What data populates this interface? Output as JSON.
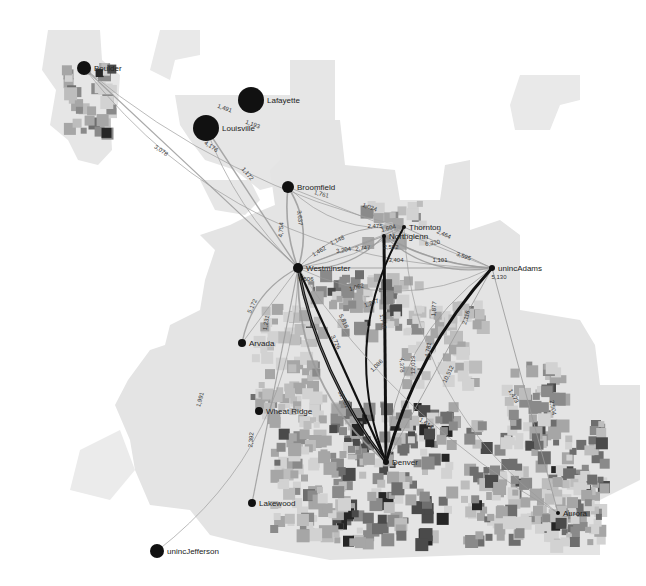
{
  "map": {
    "title": "Commuter flows, Denver metro area",
    "colors": {
      "background": "#ffffff",
      "region_light": "#e6e6e6",
      "region_mid": "#bdbdbd",
      "region_dark": "#7a7a7a",
      "region_darkest": "#262626",
      "flow_light": "#9a9a9a",
      "flow_heavy": "#111111",
      "node": "#111111"
    },
    "nodes": [
      {
        "id": "boulder",
        "label": "Boulder",
        "x": 84,
        "y": 68,
        "r": 7,
        "count": ""
      },
      {
        "id": "lafayette",
        "label": "Lafayette",
        "x": 251,
        "y": 100,
        "r": 13,
        "count": ""
      },
      {
        "id": "louisville",
        "label": "Louisville",
        "x": 206,
        "y": 128,
        "r": 13,
        "count": ""
      },
      {
        "id": "broomfield",
        "label": "Broomfield",
        "x": 288,
        "y": 187,
        "r": 6,
        "count": "3,747"
      },
      {
        "id": "thornton",
        "label": "Thornton",
        "x": 404,
        "y": 227,
        "r": 2,
        "count": ""
      },
      {
        "id": "northglenn",
        "label": "Northglenn",
        "x": 384,
        "y": 236,
        "r": 2,
        "count": "2,552"
      },
      {
        "id": "westminster",
        "label": "Westminster",
        "x": 298,
        "y": 268,
        "r": 5,
        "count": "9,506"
      },
      {
        "id": "uncadams",
        "label": "unincAdams",
        "x": 492,
        "y": 268,
        "r": 3,
        "count": "5,130"
      },
      {
        "id": "arvada",
        "label": "Arvada",
        "x": 242,
        "y": 343,
        "r": 4,
        "count": ""
      },
      {
        "id": "wheatridge",
        "label": "Wheat Ridge",
        "x": 259,
        "y": 411,
        "r": 4,
        "count": ""
      },
      {
        "id": "lakewood",
        "label": "Lakewood",
        "x": 252,
        "y": 503,
        "r": 4,
        "count": ""
      },
      {
        "id": "uncjefferson",
        "label": "unincJefferson",
        "x": 157,
        "y": 551,
        "r": 7,
        "count": ""
      },
      {
        "id": "denver",
        "label": "Denver",
        "x": 386,
        "y": 462,
        "r": 3,
        "count": ""
      },
      {
        "id": "aurora",
        "label": "Aurora",
        "x": 558,
        "y": 513,
        "r": 2,
        "count": ""
      }
    ],
    "flows": [
      {
        "from": "boulder",
        "to": "westminster",
        "value": "3,078",
        "weight": 1.2,
        "heavy": false
      },
      {
        "from": "boulder",
        "to": "thornton",
        "value": "1,491",
        "weight": 0.8,
        "heavy": false
      },
      {
        "from": "boulder",
        "to": "uncadams",
        "value": "1,193",
        "weight": 0.8,
        "heavy": false
      },
      {
        "from": "louisville",
        "to": "westminster",
        "value": "4,176",
        "weight": 1.4,
        "heavy": false
      },
      {
        "from": "louisville",
        "to": "westminster",
        "value": "1,172",
        "weight": 0.8,
        "heavy": false
      },
      {
        "from": "broomfield",
        "to": "thornton",
        "value": "1,761",
        "weight": 0.8,
        "heavy": false
      },
      {
        "from": "broomfield",
        "to": "uncadams",
        "value": "1,024",
        "weight": 0.8,
        "heavy": false
      },
      {
        "from": "broomfield",
        "to": "westminster",
        "value": "3,637",
        "weight": 1.6,
        "heavy": false
      },
      {
        "from": "westminster",
        "to": "broomfield",
        "value": "4,754",
        "weight": 1.6,
        "heavy": false
      },
      {
        "from": "westminster",
        "to": "thornton",
        "value": "1,148",
        "weight": 0.8,
        "heavy": false
      },
      {
        "from": "westminster",
        "to": "thornton",
        "value": "1,462",
        "weight": 0.8,
        "heavy": false
      },
      {
        "from": "westminster",
        "to": "northglenn",
        "value": "3,204",
        "weight": 1.2,
        "heavy": false
      },
      {
        "from": "westminster",
        "to": "northglenn",
        "value": "2,747",
        "weight": 1.1,
        "heavy": false
      },
      {
        "from": "thornton",
        "to": "northglenn",
        "value": "1,604",
        "weight": 0.8,
        "heavy": false
      },
      {
        "from": "thornton",
        "to": "westminster",
        "value": "2,475",
        "weight": 1,
        "heavy": false
      },
      {
        "from": "thornton",
        "to": "uncadams",
        "value": "2,464",
        "weight": 1,
        "heavy": false
      },
      {
        "from": "northglenn",
        "to": "uncadams",
        "value": "6,320",
        "weight": 1.6,
        "heavy": false
      },
      {
        "from": "northglenn",
        "to": "uncadams",
        "value": "3,595",
        "weight": 1.3,
        "heavy": false
      },
      {
        "from": "westminster",
        "to": "uncadams",
        "value": "3,404",
        "weight": 1.2,
        "heavy": false
      },
      {
        "from": "northglenn",
        "to": "uncadams",
        "value": "1,101",
        "weight": 0.8,
        "heavy": false
      },
      {
        "from": "westminster",
        "to": "uncadams",
        "value": "1,062",
        "weight": 0.8,
        "heavy": false
      },
      {
        "from": "westminster",
        "to": "denver",
        "value": "1,297",
        "weight": 0.8,
        "heavy": false
      },
      {
        "from": "westminster",
        "to": "denver",
        "value": "1,748",
        "weight": 0.9,
        "heavy": false
      },
      {
        "from": "westminster",
        "to": "denver",
        "value": "5,818",
        "weight": 1.8,
        "heavy": false
      },
      {
        "from": "westminster",
        "to": "denver",
        "value": "3,726",
        "weight": 2.2,
        "heavy": true
      },
      {
        "from": "westminster",
        "to": "denver",
        "value": "12,701",
        "weight": 3,
        "heavy": true
      },
      {
        "from": "westminster",
        "to": "arvada",
        "value": "5,172",
        "weight": 1.4,
        "heavy": false
      },
      {
        "from": "westminster",
        "to": "arvada",
        "value": "1,231",
        "weight": 0.8,
        "heavy": false
      },
      {
        "from": "westminster",
        "to": "denver",
        "value": "1,086",
        "weight": 0.8,
        "heavy": false
      },
      {
        "from": "thornton",
        "to": "denver",
        "value": "4,378",
        "weight": 2,
        "heavy": true
      },
      {
        "from": "northglenn",
        "to": "denver",
        "value": "12,013",
        "weight": 3,
        "heavy": true
      },
      {
        "from": "uncadams",
        "to": "denver",
        "value": "4,781",
        "weight": 1.4,
        "heavy": false
      },
      {
        "from": "uncadams",
        "to": "denver",
        "value": "1,877",
        "weight": 0.9,
        "heavy": false
      },
      {
        "from": "uncadams",
        "to": "denver",
        "value": "2,116",
        "weight": 1,
        "heavy": false
      },
      {
        "from": "uncadams",
        "to": "denver",
        "value": "10,512",
        "weight": 3,
        "heavy": true
      },
      {
        "from": "thornton",
        "to": "aurora",
        "value": "1,473",
        "weight": 0.8,
        "heavy": false
      },
      {
        "from": "uncadams",
        "to": "aurora",
        "value": "2,504",
        "weight": 1,
        "heavy": false
      },
      {
        "from": "westminster",
        "to": "aurora",
        "value": "1,614",
        "weight": 0.8,
        "heavy": false
      },
      {
        "from": "uncjefferson",
        "to": "westminster",
        "value": "1,991",
        "weight": 0.8,
        "heavy": false
      },
      {
        "from": "lakewood",
        "to": "westminster",
        "value": "2,392",
        "weight": 1.2,
        "heavy": false
      }
    ],
    "flow_label_positions": [
      {
        "value": "3,078",
        "x": 160,
        "y": 152,
        "rot": 35
      },
      {
        "value": "1,491",
        "x": 224,
        "y": 110,
        "rot": 20
      },
      {
        "value": "1,193",
        "x": 252,
        "y": 126,
        "rot": 20
      },
      {
        "value": "4,176",
        "x": 210,
        "y": 148,
        "rot": 35
      },
      {
        "value": "1,172",
        "x": 246,
        "y": 175,
        "rot": 50
      },
      {
        "value": "1,761",
        "x": 321,
        "y": 196,
        "rot": 15
      },
      {
        "value": "1,024",
        "x": 369,
        "y": 209,
        "rot": 20
      },
      {
        "value": "3,637",
        "x": 298,
        "y": 218,
        "rot": 85
      },
      {
        "value": "4,754",
        "x": 283,
        "y": 230,
        "rot": -85
      },
      {
        "value": "1,148",
        "x": 338,
        "y": 242,
        "rot": -25
      },
      {
        "value": "1,462",
        "x": 320,
        "y": 253,
        "rot": -30
      },
      {
        "value": "3,204",
        "x": 344,
        "y": 252,
        "rot": -10
      },
      {
        "value": "2,747",
        "x": 363,
        "y": 250,
        "rot": -5
      },
      {
        "value": "1,604",
        "x": 389,
        "y": 230,
        "rot": -15
      },
      {
        "value": "2,475",
        "x": 375,
        "y": 228,
        "rot": 0
      },
      {
        "value": "2,552",
        "x": 391,
        "y": 249,
        "rot": 0
      },
      {
        "value": "2,464",
        "x": 443,
        "y": 236,
        "rot": 25
      },
      {
        "value": "6,320",
        "x": 433,
        "y": 245,
        "rot": -10
      },
      {
        "value": "3,595",
        "x": 463,
        "y": 258,
        "rot": 20
      },
      {
        "value": "1,101",
        "x": 440,
        "y": 262,
        "rot": 0
      },
      {
        "value": "3,404",
        "x": 396,
        "y": 262,
        "rot": 0
      },
      {
        "value": "9,506",
        "x": 306,
        "y": 281,
        "rot": 0
      },
      {
        "value": "5,130",
        "x": 499,
        "y": 279,
        "rot": 0
      },
      {
        "value": "1,062",
        "x": 357,
        "y": 289,
        "rot": -15
      },
      {
        "value": "1,297",
        "x": 372,
        "y": 305,
        "rot": -20
      },
      {
        "value": "1,748",
        "x": 381,
        "y": 322,
        "rot": 80
      },
      {
        "value": "5,818",
        "x": 342,
        "y": 322,
        "rot": 65
      },
      {
        "value": "3,726",
        "x": 334,
        "y": 343,
        "rot": 65
      },
      {
        "value": "5,172",
        "x": 254,
        "y": 307,
        "rot": -65
      },
      {
        "value": "1,231",
        "x": 268,
        "y": 323,
        "rot": -80
      },
      {
        "value": "1,086",
        "x": 378,
        "y": 367,
        "rot": -45
      },
      {
        "value": "12,701",
        "x": 342,
        "y": 400,
        "rot": 65
      },
      {
        "value": "4,378",
        "x": 400,
        "y": 365,
        "rot": 90
      },
      {
        "value": "12,013",
        "x": 415,
        "y": 365,
        "rot": -90
      },
      {
        "value": "4,781",
        "x": 430,
        "y": 350,
        "rot": -80
      },
      {
        "value": "1,877",
        "x": 436,
        "y": 309,
        "rot": -85
      },
      {
        "value": "2,116",
        "x": 468,
        "y": 318,
        "rot": -75
      },
      {
        "value": "10,512",
        "x": 450,
        "y": 375,
        "rot": -65
      },
      {
        "value": "1,473",
        "x": 512,
        "y": 397,
        "rot": 60
      },
      {
        "value": "2,504",
        "x": 551,
        "y": 408,
        "rot": 80
      },
      {
        "value": "1,614",
        "x": 425,
        "y": 425,
        "rot": 35
      },
      {
        "value": "1,991",
        "x": 202,
        "y": 400,
        "rot": -75
      },
      {
        "value": "2,392",
        "x": 253,
        "y": 440,
        "rot": -85
      }
    ]
  }
}
